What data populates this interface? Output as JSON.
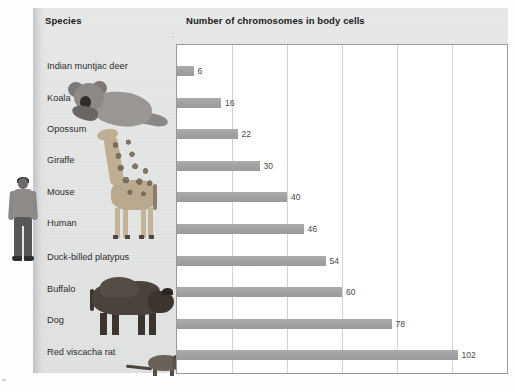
{
  "headers": {
    "species": "Species",
    "chart": "Number of chromosomes in body cells"
  },
  "chart_data": {
    "type": "bar",
    "orientation": "horizontal",
    "title": "Number of chromosomes in body cells",
    "xlabel": "",
    "ylabel": "Species",
    "xlim": [
      0,
      120
    ],
    "grid": true,
    "gridlines_every": 20,
    "legend": "none",
    "categories": [
      "Indian muntjac deer",
      "Koala",
      "Opossum",
      "Giraffe",
      "Mouse",
      "Human",
      "Duck-billed platypus",
      "Buffalo",
      "Dog",
      "Red viscacha rat"
    ],
    "values": [
      6,
      16,
      22,
      30,
      40,
      46,
      54,
      60,
      78,
      102
    ],
    "value_labels": [
      "6",
      "16",
      "22",
      "30",
      "40",
      "46",
      "54",
      "60",
      "78",
      "102"
    ],
    "bar_color": "#a2a2a2",
    "plot_background": "#ffffff",
    "panel_background": "#e3e4e4"
  },
  "illustrations": [
    {
      "name": "human-illustration"
    },
    {
      "name": "koala-illustration"
    },
    {
      "name": "giraffe-illustration"
    },
    {
      "name": "buffalo-illustration"
    },
    {
      "name": "red-viscacha-rat-illustration"
    }
  ]
}
